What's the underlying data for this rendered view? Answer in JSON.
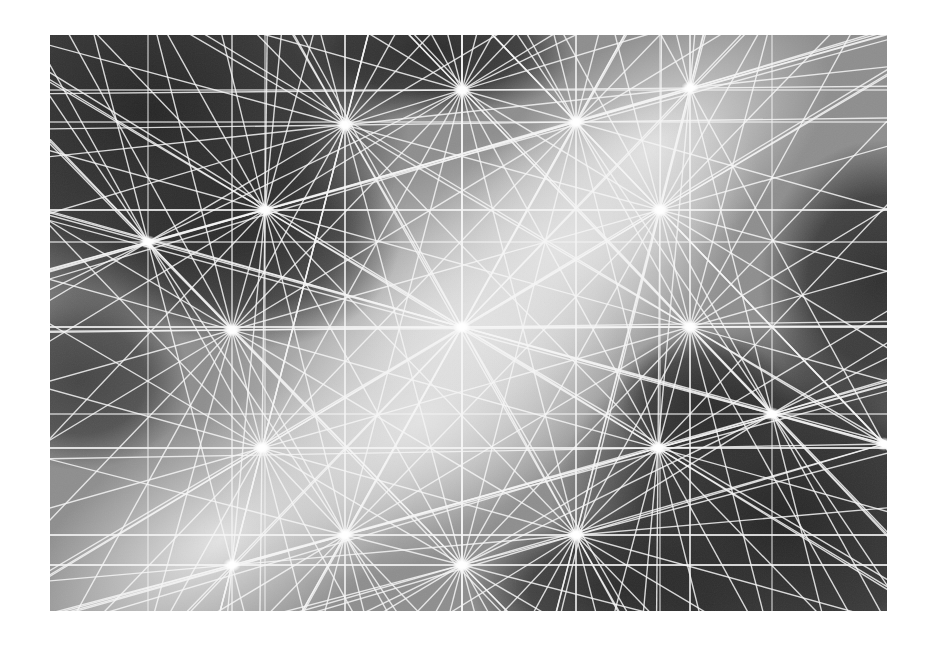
{
  "image": {
    "description": "Abstract grayscale geometric artwork: a network of white lines radiating from bright star-like nodes over a soft dark/light gradient field",
    "frame": {
      "x": 50,
      "y": 35,
      "width": 837,
      "height": 576
    },
    "colors": {
      "background": "#ffffff",
      "dark": "#2e2e2e",
      "light": "#dedede",
      "line": "#f2f2f2",
      "node": "#ffffff"
    },
    "nodes": [
      [
        148,
        242
      ],
      [
        265,
        210
      ],
      [
        345,
        125
      ],
      [
        462,
        90
      ],
      [
        576,
        122
      ],
      [
        690,
        88
      ],
      [
        660,
        210
      ],
      [
        232,
        330
      ],
      [
        462,
        327
      ],
      [
        690,
        327
      ],
      [
        262,
        448
      ],
      [
        658,
        448
      ],
      [
        772,
        414
      ],
      [
        884,
        444
      ],
      [
        232,
        565
      ],
      [
        345,
        535
      ],
      [
        462,
        565
      ],
      [
        576,
        535
      ]
    ],
    "grid_x": [
      148,
      265,
      345,
      462,
      576,
      660,
      690,
      772
    ],
    "grid_y": [
      90,
      122,
      210,
      242,
      327,
      414,
      448,
      535,
      565
    ]
  }
}
